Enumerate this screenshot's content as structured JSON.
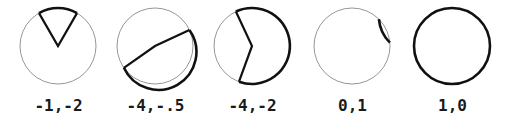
{
  "figure": {
    "type": "arc-sector-diagram",
    "width": 509,
    "height": 134,
    "background_color": "#ffffff",
    "thin_stroke_color": "#8a8a8a",
    "bold_stroke_color": "#111111",
    "caption_color": "#1a1a1a",
    "circle_radius": 38,
    "panel_count": 5
  },
  "panels": [
    {
      "index": 0,
      "caption": "-1,-2",
      "values": [
        "-1",
        "-2"
      ],
      "center_x": 58,
      "center_y": 46,
      "radius": 38,
      "highlight": {
        "start_angle_deg": 60,
        "end_angle_deg": 120,
        "sweep_deg": 60,
        "has_radii": true,
        "full_circle": false
      }
    },
    {
      "index": 1,
      "caption": "-4,-.5",
      "values": [
        "-4",
        "-.5"
      ],
      "center_x": 155,
      "center_y": 46,
      "radius": 38,
      "highlight": {
        "start_angle_deg": 25,
        "end_angle_deg": 215,
        "sweep_deg": 190,
        "has_radii": true,
        "full_circle": false
      }
    },
    {
      "index": 2,
      "caption": "-4,-2",
      "values": [
        "-4",
        "-2"
      ],
      "center_x": 252,
      "center_y": 46,
      "radius": 38,
      "highlight": {
        "start_angle_deg": -110,
        "end_angle_deg": 115,
        "sweep_deg": 225,
        "has_radii": true,
        "full_circle": false
      }
    },
    {
      "index": 3,
      "caption": "0,1",
      "values": [
        "0",
        "1"
      ],
      "center_x": 352,
      "center_y": 46,
      "radius": 38,
      "highlight": {
        "start_angle_deg": 5,
        "end_angle_deg": 45,
        "sweep_deg": 40,
        "has_radii": false,
        "full_circle": false
      }
    },
    {
      "index": 4,
      "caption": "1,0",
      "values": [
        "1",
        "0"
      ],
      "center_x": 452,
      "center_y": 46,
      "radius": 38,
      "highlight": {
        "start_angle_deg": 0,
        "end_angle_deg": 360,
        "sweep_deg": 360,
        "has_radii": false,
        "full_circle": true
      }
    }
  ]
}
